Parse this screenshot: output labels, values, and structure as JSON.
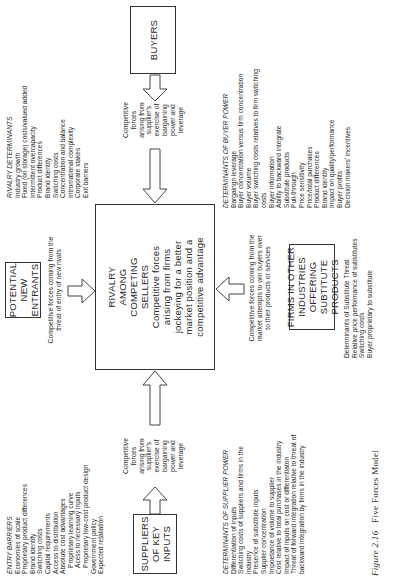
{
  "figure": {
    "caption_number": "Figure 2.16",
    "caption_title": "Five Forces Model"
  },
  "boxes": {
    "potential_entrants": [
      "POTENTIAL",
      "NEW ENTRANTS"
    ],
    "rivalry": {
      "title": [
        "RIVALRY",
        "AMONG",
        "COMPETING",
        "SELLERS"
      ],
      "body": [
        "Competitive forces",
        "arising from firms",
        "jockeying for a better",
        "market position and a",
        "competitive advantage"
      ]
    },
    "suppliers": [
      "SUPPLIERS",
      "OF KEY",
      "INPUTS"
    ],
    "buyers": [
      "BUYERS"
    ],
    "substitutes": [
      "FIRMS IN OTHER",
      "INDUSTRIES OFFERING",
      "SUBTITUTE PRODUCTS"
    ]
  },
  "notes": {
    "entrants_force": [
      "Competitive forces coming from the",
      "threat of entry of new rivals"
    ],
    "supplier_force": [
      "Competitive",
      "forces",
      "arising from",
      "supplier's",
      "exercise of",
      "bargaining",
      "power and",
      "leverage"
    ],
    "buyer_force": [
      "Competitive",
      "forces",
      "arising from",
      "supplier's",
      "exercise of",
      "bargaining",
      "power and",
      "leverage"
    ],
    "substitute_force": [
      "Competitive forces coming from the",
      "market attempts to win buyers over",
      "to their products or services"
    ]
  },
  "lists": {
    "entry_barriers": {
      "heading": "ENTRY BARRIERS",
      "items": [
        {
          "text": "Economies of scale",
          "indent": false
        },
        {
          "text": "Proprietary product differences",
          "indent": false
        },
        {
          "text": "Brand identify",
          "indent": false
        },
        {
          "text": "Switching costs",
          "indent": false
        },
        {
          "text": "Capital requirements",
          "indent": false
        },
        {
          "text": "Access to distribution",
          "indent": false
        },
        {
          "text": "Absolute cost advantages",
          "indent": false
        },
        {
          "text": "Proprietary learning curve",
          "indent": true
        },
        {
          "text": "Acess to necessary inputs",
          "indent": true
        },
        {
          "text": "Proprietary low-cost product design",
          "indent": true
        },
        {
          "text": "Government policy",
          "indent": false
        },
        {
          "text": "Expected retaliation",
          "indent": false
        }
      ]
    },
    "rivalry_determinants": {
      "heading": "RIVALRY DETERMINANTS",
      "items": [
        "Industry growth",
        "Fixed (on storage) costs/valued added",
        "Intermittent overcapacity",
        "Product differences",
        "Brand identity",
        "Switching costs",
        "Concentration and balance",
        "Intromational complexity",
        "Corporate stakes",
        "Exit barriers"
      ]
    },
    "supplier_power": {
      "heading": "DETERMINANTS OF SUPPLIER POWER",
      "items": [
        "Differentiation of inputs",
        "Switching costs of suppliers and firms in the",
        "industry",
        "Presence of substitute inputs",
        "Supplier concentration",
        "Impoetance of volume to supplier",
        "Cost relative to total purchases in the industry",
        "Impact of inputs on cost or differentiaton",
        "Threat of forward integration relative to threat of",
        "backward integration by firms in the industry"
      ]
    },
    "buyer_power": {
      "heading": "DETERMINANTS OF BUYER POWER",
      "items": [
        "Bargaingn leverage",
        "Buyer concentration versus firm concentration",
        "Buyer volume",
        "Buyer switching costs relatives to firm switching",
        "costs",
        "Buyer information",
        "Ability to backward integrate",
        "Substitule products",
        "Pull-through",
        "Price sensitivity",
        "Price/total purchases",
        "Product differences",
        "Brand identity",
        "Impact on quality/performance",
        "Buyer profits",
        "Decision makers' incentives"
      ]
    },
    "substitute_threat": {
      "heading": "Determinants of Substitute Threat",
      "items": [
        "Relative price performance of substitutes",
        "Switching costs",
        "Buyer proprietary to substitute"
      ]
    }
  }
}
